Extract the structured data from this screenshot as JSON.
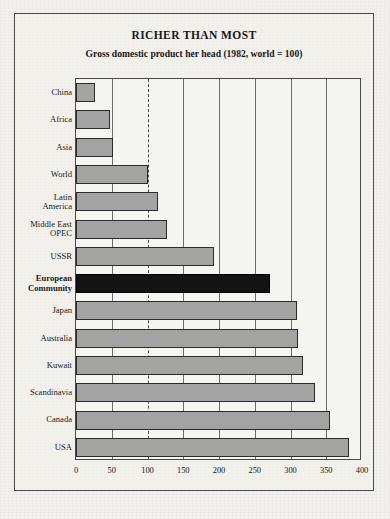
{
  "figure": {
    "title": "RICHER THAN MOST",
    "subtitle": "Gross domestic product her head (1982, world = 100)",
    "frame_color": "#4c4c4c",
    "page_background": "#f1f0ec"
  },
  "chart_data": {
    "type": "bar",
    "orientation": "horizontal",
    "title": "RICHER THAN MOST",
    "subtitle": "Gross domestic product her head (1982, world = 100)",
    "xlabel": "",
    "ylabel": "",
    "xlim": [
      0,
      400
    ],
    "xticks": [
      0,
      50,
      100,
      150,
      200,
      250,
      300,
      350,
      400
    ],
    "xtick_labels": [
      "0",
      "50",
      "100",
      "150",
      "200",
      "250",
      "300",
      "350",
      "400"
    ],
    "grid": "vertical",
    "reference_line": {
      "value": 100,
      "style": "dashed",
      "label": "world = 100"
    },
    "legend": null,
    "bar_color": "#a3a3a3",
    "bar_edge_color": "#2b2b2b",
    "highlight_color": "#131313",
    "categories": [
      "China",
      "Africa",
      "Asia",
      "World",
      "Latin America",
      "Middle East OPEC",
      "USSR",
      "European Community",
      "Japan",
      "Australia",
      "Kuwait",
      "Scandinavia",
      "Canada",
      "USA"
    ],
    "values": [
      27,
      48,
      52,
      100,
      115,
      127,
      193,
      271,
      309,
      310,
      318,
      334,
      355,
      382
    ],
    "highlighted_category": "European Community",
    "bars": [
      {
        "label": "China",
        "label_lines": [
          "China"
        ],
        "value": 27,
        "highlight": false
      },
      {
        "label": "Africa",
        "label_lines": [
          "Africa"
        ],
        "value": 48,
        "highlight": false
      },
      {
        "label": "Asia",
        "label_lines": [
          "Asia"
        ],
        "value": 52,
        "highlight": false
      },
      {
        "label": "World",
        "label_lines": [
          "World"
        ],
        "value": 100,
        "highlight": false
      },
      {
        "label": "Latin America",
        "label_lines": [
          "Latin",
          "America"
        ],
        "value": 115,
        "highlight": false
      },
      {
        "label": "Middle East OPEC",
        "label_lines": [
          "Middle East",
          "OPEC"
        ],
        "value": 127,
        "highlight": false
      },
      {
        "label": "USSR",
        "label_lines": [
          "USSR"
        ],
        "value": 193,
        "highlight": false
      },
      {
        "label": "European Community",
        "label_lines": [
          "European",
          "Community"
        ],
        "value": 271,
        "highlight": true
      },
      {
        "label": "Japan",
        "label_lines": [
          "Japan"
        ],
        "value": 309,
        "highlight": false
      },
      {
        "label": "Australia",
        "label_lines": [
          "Australia"
        ],
        "value": 310,
        "highlight": false
      },
      {
        "label": "Kuwait",
        "label_lines": [
          "Kuwait"
        ],
        "value": 318,
        "highlight": false
      },
      {
        "label": "Scandinavia",
        "label_lines": [
          "Scandinavia"
        ],
        "value": 334,
        "highlight": false
      },
      {
        "label": "Canada",
        "label_lines": [
          "Canada"
        ],
        "value": 355,
        "highlight": false
      },
      {
        "label": "USA",
        "label_lines": [
          "USA"
        ],
        "value": 382,
        "highlight": false
      }
    ]
  }
}
